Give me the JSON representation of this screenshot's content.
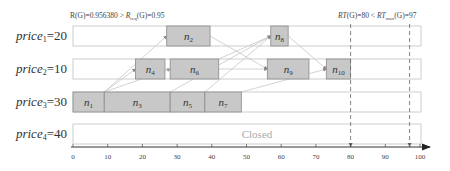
{
  "rows": [
    {
      "id": "price1",
      "label_base": "price",
      "label_sub": "1",
      "label_value": "=20"
    },
    {
      "id": "price2",
      "label_base": "price",
      "label_sub": "2",
      "label_value": "=10"
    },
    {
      "id": "price3",
      "label_base": "price",
      "label_sub": "3",
      "label_value": "=30"
    },
    {
      "id": "price4",
      "label_base": "price",
      "label_sub": "4",
      "label_value": "=40",
      "status": "Closed"
    }
  ],
  "tasks": [
    {
      "name": "n1",
      "base": "n",
      "sub": "1",
      "row": 2,
      "start": 0,
      "end": 9
    },
    {
      "name": "n3",
      "base": "n",
      "sub": "3",
      "row": 2,
      "start": 9,
      "end": 28
    },
    {
      "name": "n5",
      "base": "n",
      "sub": "5",
      "row": 2,
      "start": 28,
      "end": 38
    },
    {
      "name": "n7",
      "base": "n",
      "sub": "7",
      "row": 2,
      "start": 38,
      "end": 48.5
    },
    {
      "name": "n2",
      "base": "n",
      "sub": "2",
      "row": 0,
      "start": 27,
      "end": 39.5
    },
    {
      "name": "n4",
      "base": "n",
      "sub": "4",
      "row": 1,
      "start": 18,
      "end": 26.5
    },
    {
      "name": "n6",
      "base": "n",
      "sub": "6",
      "row": 1,
      "start": 28,
      "end": 42
    },
    {
      "name": "n8",
      "base": "n",
      "sub": "8",
      "row": 0,
      "start": 57,
      "end": 62
    },
    {
      "name": "n9",
      "base": "n",
      "sub": "9",
      "row": 1,
      "start": 56,
      "end": 68
    },
    {
      "name": "n10",
      "base": "n",
      "sub": "10",
      "row": 1,
      "start": 73,
      "end": 80
    }
  ],
  "edges": [
    {
      "from": "n1",
      "to": "n2"
    },
    {
      "from": "n1",
      "to": "n4"
    },
    {
      "from": "n1",
      "to": "n6"
    },
    {
      "from": "n3",
      "to": "n8"
    },
    {
      "from": "n2",
      "to": "n9"
    },
    {
      "from": "n5",
      "to": "n8"
    },
    {
      "from": "n6",
      "to": "n8"
    },
    {
      "from": "n8",
      "to": "n10"
    },
    {
      "from": "n7",
      "to": "n10"
    },
    {
      "from": "n4",
      "to": "n9"
    }
  ],
  "axis": {
    "min": 0,
    "max": 100,
    "ticks": [
      0,
      10,
      20,
      30,
      40,
      50,
      60,
      70,
      80,
      90,
      100
    ]
  },
  "markers": [
    {
      "name": "RT",
      "value": 80
    },
    {
      "name": "RTmax",
      "value": 97
    }
  ],
  "annotations": {
    "reliability": "R(G)=0.956380 > R_req(G)=0.95",
    "reliability_parts": {
      "a": "R(G)=0.956380 > ",
      "b": "R",
      "b_sub": "req",
      "c": "(G)=0.95"
    },
    "response_time": "RT(G)=80 < RT_max(G)=97",
    "response_time_parts": {
      "a": "RT(G)=80 < ",
      "b": "RT",
      "b_sub": "max",
      "c": "(G)=97"
    }
  },
  "colors": {
    "box_fill": "#c8c8c8",
    "box_stroke": "#8a8a8a",
    "row_stroke": "#c0c0c0",
    "edge": "#c8c8c8",
    "axis": "#333333",
    "marker": "#666666"
  }
}
